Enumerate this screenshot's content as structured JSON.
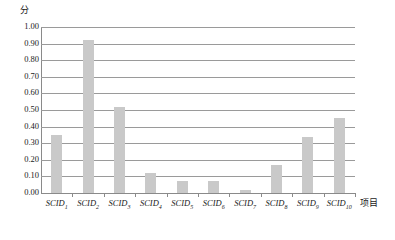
{
  "chart_data": {
    "type": "bar",
    "title": "",
    "subtitle": "",
    "xlabel": "项目",
    "ylabel": "分",
    "categories": [
      "SCID_1",
      "SCID_2",
      "SCID_3",
      "SCID_4",
      "SCID_5",
      "SCID_6",
      "SCID_7",
      "SCID_8",
      "SCID_9",
      "SCID_10"
    ],
    "category_labels": [
      {
        "base": "SCID",
        "sub": "1"
      },
      {
        "base": "SCID",
        "sub": "2"
      },
      {
        "base": "SCID",
        "sub": "3"
      },
      {
        "base": "SCID",
        "sub": "4"
      },
      {
        "base": "SCID",
        "sub": "5"
      },
      {
        "base": "SCID",
        "sub": "6"
      },
      {
        "base": "SCID",
        "sub": "7"
      },
      {
        "base": "SCID",
        "sub": "8"
      },
      {
        "base": "SCID",
        "sub": "9"
      },
      {
        "base": "SCID",
        "sub": "10"
      }
    ],
    "values": [
      0.35,
      0.92,
      0.52,
      0.12,
      0.07,
      0.07,
      0.02,
      0.17,
      0.34,
      0.45
    ],
    "ylim": [
      0.0,
      1.0
    ],
    "ytick_step": 0.1,
    "ytick_labels": [
      "1.00",
      "0.90",
      "0.80",
      "0.70",
      "0.60",
      "0.50",
      "0.40",
      "0.30",
      "0.20",
      "0.10",
      "0.00"
    ],
    "ytick_values": [
      1.0,
      0.9,
      0.8,
      0.7,
      0.6,
      0.5,
      0.4,
      0.3,
      0.2,
      0.1,
      0.0
    ],
    "grid": true,
    "legend": false,
    "legend_position": "none",
    "bar_color": "#c9c9c9",
    "gridline_color": "#9a9a9a",
    "axis_color": "#8a8a8a",
    "background_color": "#ffffff",
    "text_color": "#1a1a1a"
  }
}
